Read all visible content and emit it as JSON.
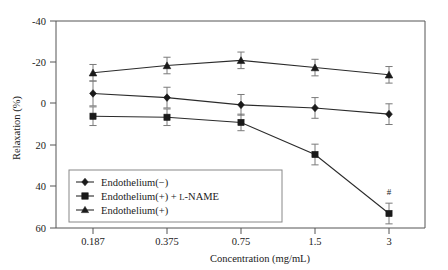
{
  "chart_data": {
    "type": "line",
    "title": "",
    "xlabel": "Concentration (mg/mL)",
    "ylabel": "Relaxation (%)",
    "categories": [
      "0.187",
      "0.375",
      "0.75",
      "1.5",
      "3"
    ],
    "x_tick_labels": [
      "0.187",
      "0.375",
      "0.75",
      "1.5",
      "3"
    ],
    "y_tick_labels": [
      "-40",
      "-20",
      "0",
      "20",
      "40",
      "60"
    ],
    "y_ticks": [
      -40,
      -20,
      0,
      20,
      40,
      60
    ],
    "ylim": [
      -40,
      60
    ],
    "y_axis_inverted": true,
    "grid": false,
    "legend_position": "inside lower-left",
    "series": [
      {
        "name": "Endothelium(−)",
        "marker": "diamond",
        "values": [
          -5,
          -3,
          0.5,
          2,
          5
        ],
        "errors": [
          6,
          5,
          5,
          5,
          5
        ]
      },
      {
        "name": "Endothelium(+) + L-NAME",
        "marker": "square",
        "values": [
          6,
          6.5,
          9,
          24.5,
          53
        ],
        "errors": [
          4.5,
          4,
          4,
          5,
          5
        ]
      },
      {
        "name": "Endothelium(+)",
        "marker": "triangle",
        "values": [
          -15,
          -18.5,
          -21,
          -17.5,
          -14
        ],
        "errors": [
          4,
          4,
          4,
          4,
          4
        ]
      }
    ],
    "annotations": [
      {
        "text": "#",
        "x_category": "3",
        "y": 44,
        "series": "Endothelium(+) + L-NAME"
      }
    ]
  },
  "legend": {
    "entries": [
      {
        "label": "Endothelium(−)",
        "marker": "diamond"
      },
      {
        "label_pre": "Endothelium(+) + ",
        "label_sc": "L",
        "label_post": "-NAME",
        "marker": "square"
      },
      {
        "label": "Endothelium(+)",
        "marker": "triangle"
      }
    ]
  },
  "axes": {
    "x_title": "Concentration (mg/mL)",
    "y_title": "Relaxation (%)"
  },
  "colors": {
    "line": "#2b2b2b",
    "marker": "#1a1a1a",
    "error": "#7a7a7a",
    "frame": "#555555",
    "background": "#ffffff"
  }
}
